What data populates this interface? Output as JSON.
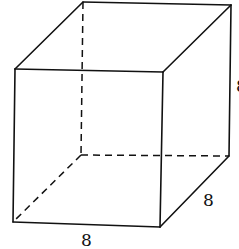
{
  "figure": {
    "type": "cube",
    "vertices": {
      "front_top_left": [
        15,
        69
      ],
      "front_top_right": [
        163,
        72
      ],
      "front_bottom_left": [
        13,
        222
      ],
      "front_bottom_right": [
        160,
        227
      ],
      "back_top_left": [
        83,
        2
      ],
      "back_top_right": [
        231,
        5
      ],
      "back_bottom_left": [
        81,
        155
      ],
      "back_bottom_right": [
        229,
        156
      ]
    },
    "labels": {
      "bottom_edge": "8",
      "depth_edge": "8",
      "right_edge": "8"
    },
    "colors": {
      "stroke": "#111111",
      "background": "#ffffff"
    }
  }
}
